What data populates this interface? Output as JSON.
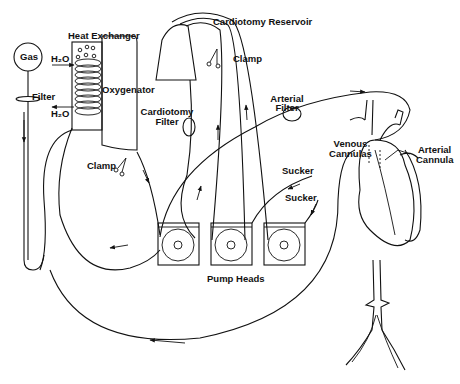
{
  "diagram": {
    "labels": {
      "gas": "Gas",
      "filter": "Filter",
      "heat_exchanger": "Heat Exchanger",
      "h2o_in": "H₂O",
      "h2o_out": "H₂O",
      "oxygenator": "Oxygenator",
      "cardiotomy_reservoir": "Cardiotomy Reservoir",
      "clamp_top": "Clamp",
      "cardiotomy_filter_line1": "Cardiotomy",
      "cardiotomy_filter_line2": "Filter",
      "arterial_filter_line1": "Arterial",
      "arterial_filter_line2": "Filter",
      "clamp_left": "Clamp",
      "venous_cannulas_line1": "Venous",
      "venous_cannulas_line2": "Cannulas",
      "arterial_cannula_line1": "Arterial",
      "arterial_cannula_line2": "Cannula",
      "sucker_1": "Sucker",
      "sucker_2": "Sucker",
      "pump_heads": "Pump Heads"
    },
    "components": [
      "gas-source",
      "gas-filter",
      "heat-exchanger",
      "oxygenator",
      "cardiotomy-reservoir",
      "cardiotomy-filter",
      "arterial-filter",
      "pump-head-1",
      "pump-head-2",
      "pump-head-3",
      "heart",
      "venous-cannulas",
      "arterial-cannula",
      "suckers",
      "clamps"
    ]
  }
}
